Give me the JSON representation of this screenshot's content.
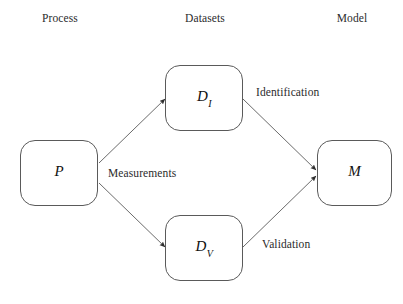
{
  "diagram": {
    "background_color": "#ffffff",
    "line_color": "#5a5a5a",
    "text_color": "#2b2b2b",
    "columns": [
      {
        "label": "Process",
        "x": 60
      },
      {
        "label": "Datasets",
        "x": 205
      },
      {
        "label": "Model",
        "x": 352
      }
    ],
    "nodes": [
      {
        "id": "process",
        "label": "P",
        "sub": "",
        "x": 20,
        "y": 140,
        "w": 78,
        "h": 66
      },
      {
        "id": "dataset-identification",
        "label": "D",
        "sub": "I",
        "x": 165,
        "y": 65,
        "w": 78,
        "h": 66
      },
      {
        "id": "dataset-validation",
        "label": "D",
        "sub": "V",
        "x": 165,
        "y": 215,
        "w": 78,
        "h": 66
      },
      {
        "id": "model",
        "label": "M",
        "sub": "",
        "x": 317,
        "y": 140,
        "w": 75,
        "h": 66
      }
    ],
    "edges": [
      {
        "id": "process-to-identification",
        "from": "process",
        "to": "dataset-identification",
        "label": "Measurements"
      },
      {
        "id": "process-to-validation",
        "from": "process",
        "to": "dataset-validation",
        "label": ""
      },
      {
        "id": "identification-to-model",
        "from": "dataset-identification",
        "to": "model",
        "label": "Identification"
      },
      {
        "id": "validation-to-model",
        "from": "dataset-validation",
        "to": "model",
        "label": "Validation"
      }
    ],
    "edge_labels": [
      {
        "id": "measurements",
        "text": "Measurements",
        "x": 108,
        "y": 167
      },
      {
        "id": "identification",
        "text": "Identification",
        "x": 256,
        "y": 86
      },
      {
        "id": "validation",
        "text": "Validation",
        "x": 262,
        "y": 238
      }
    ]
  }
}
